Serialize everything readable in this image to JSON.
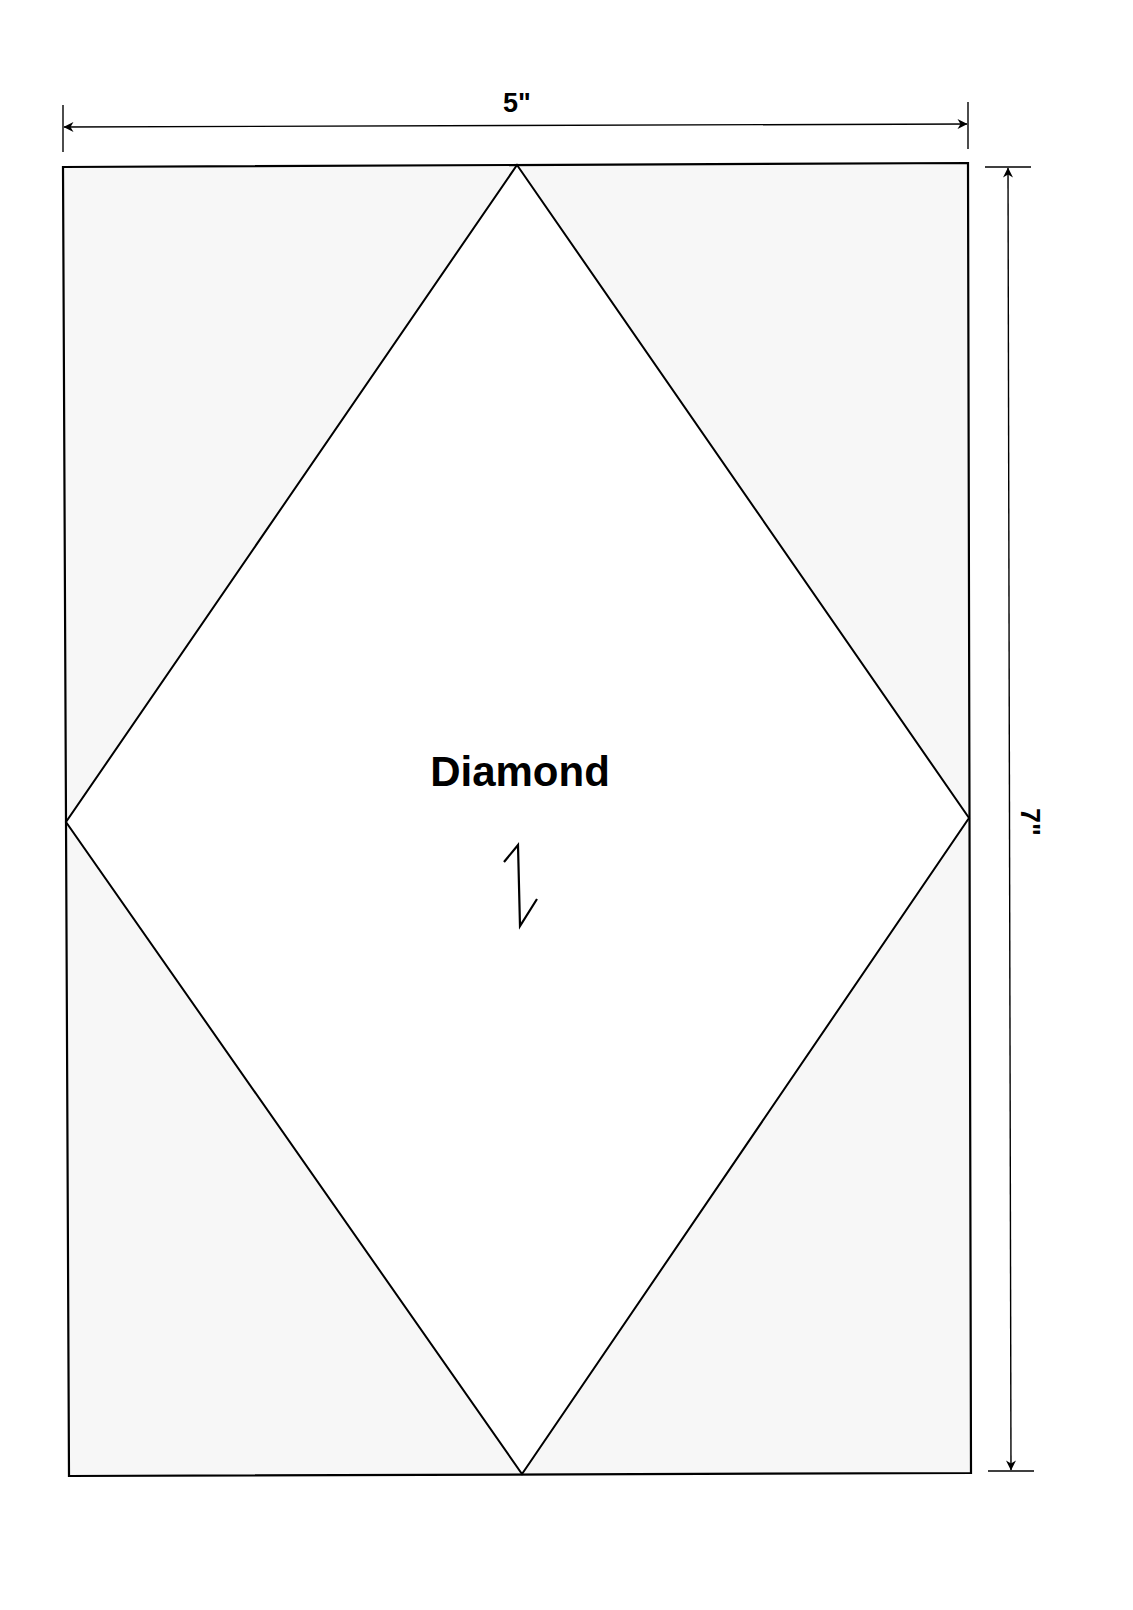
{
  "diagram": {
    "type": "template-pattern",
    "shape_label": "Diamond",
    "grain_arrow_icon": "grain-line-arrow-icon",
    "dimensions": {
      "width_label": "5\"",
      "height_label": "7\""
    },
    "colors": {
      "line": "#000000",
      "corner_fill": "#f7f7f7",
      "diamond_fill": "#ffffff",
      "background": "#ffffff"
    }
  }
}
